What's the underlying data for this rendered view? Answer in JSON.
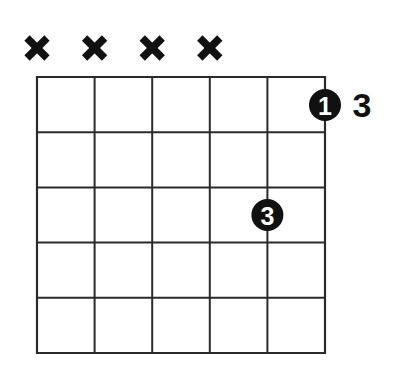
{
  "diagram": {
    "type": "guitar-chord-diagram",
    "title": "",
    "strings": 6,
    "frets": 5,
    "colors": {
      "background": "#ffffff",
      "grid": "#2b2b2b",
      "ink": "#111111",
      "marker_text": "#ffffff"
    },
    "geometry": {
      "grid_left": 37,
      "grid_right": 325,
      "grid_top": 77,
      "grid_bottom": 353,
      "string_x": [
        37,
        94.6,
        152.2,
        209.8,
        267.4,
        325
      ],
      "fret_y": [
        77,
        132.2,
        187.4,
        242.6,
        297.8,
        353
      ],
      "grid_line_width": 2,
      "marker_radius": 16
    },
    "string_markers": [
      {
        "id": "string-1",
        "symbol": "X",
        "name": "mute",
        "x": 37,
        "y": 48
      },
      {
        "id": "string-2",
        "symbol": "X",
        "name": "mute",
        "x": 94.6,
        "y": 48
      },
      {
        "id": "string-3",
        "symbol": "X",
        "name": "mute",
        "x": 152.2,
        "y": 48
      },
      {
        "id": "string-4",
        "symbol": "X",
        "name": "mute",
        "x": 209.8,
        "y": 48
      },
      {
        "id": "string-5",
        "symbol": "",
        "name": "none",
        "x": 267.4,
        "y": 48
      },
      {
        "id": "string-6",
        "symbol": "",
        "name": "none",
        "x": 325,
        "y": 48
      }
    ],
    "finger_dots": [
      {
        "id": "dot-1",
        "label": "1",
        "string": 6,
        "fret": 1,
        "cx": 325,
        "cy": 105,
        "r": 16
      },
      {
        "id": "dot-2",
        "label": "3",
        "string": 5,
        "fret": 3,
        "cx": 267.4,
        "cy": 215,
        "r": 16
      }
    ],
    "annotations": [
      {
        "id": "fret-position",
        "text": "3",
        "x": 362,
        "y": 105
      }
    ]
  }
}
